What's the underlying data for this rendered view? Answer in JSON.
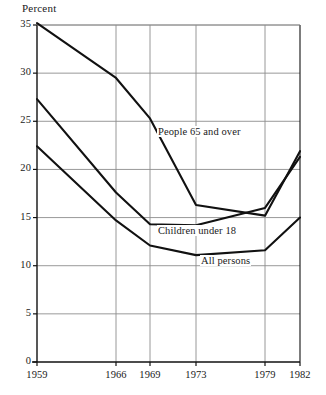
{
  "chart_data": {
    "type": "line",
    "title": "",
    "ylabel": "Percent",
    "xlabel": "",
    "ylim": [
      0,
      35
    ],
    "yticks": [
      0,
      5,
      10,
      15,
      20,
      25,
      30,
      35
    ],
    "ytick_labels": [
      "0",
      "5",
      "10",
      "15",
      "20",
      "25",
      "30",
      "35"
    ],
    "x": [
      1959,
      1966,
      1969,
      1973,
      1979,
      1982
    ],
    "xtick_labels": [
      "1959",
      "1966",
      "1969",
      "1973",
      "1979",
      "1982"
    ],
    "grid": true,
    "legend_position": "inline-annotations",
    "series": [
      {
        "name": "People 65 and over",
        "values": [
          35.2,
          29.5,
          25.3,
          16.3,
          15.2,
          21.9
        ],
        "color": "#111111"
      },
      {
        "name": "Children under 18",
        "values": [
          27.3,
          17.6,
          14.3,
          14.2,
          16.0,
          21.3
        ],
        "color": "#111111"
      },
      {
        "name": "All persons",
        "values": [
          22.4,
          14.7,
          12.1,
          11.1,
          11.6,
          15.0
        ],
        "color": "#111111"
      }
    ],
    "annotations": [
      {
        "text": "People 65 and over",
        "x_px": 157,
        "y_px": 133
      },
      {
        "text": "Children under 18",
        "x_px": 157,
        "y_px": 232
      },
      {
        "text": "All persons",
        "x_px": 200,
        "y_px": 262
      }
    ],
    "colors": {
      "line": "#111111",
      "grid": "#8d8d8d",
      "axis": "#111111",
      "background": "#ffffff"
    }
  }
}
